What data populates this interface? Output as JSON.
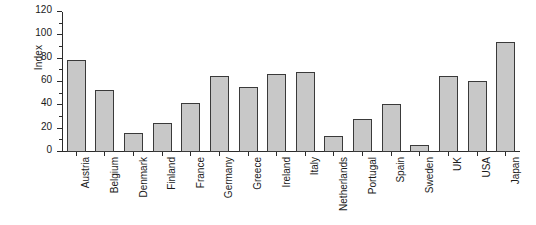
{
  "chart_data": {
    "type": "bar",
    "title": "",
    "xlabel": "",
    "ylabel": "Index",
    "ylim": [
      0,
      120
    ],
    "ytick_step": 20,
    "yminor_step": 10,
    "grid": false,
    "legend": "none",
    "orientation": "vertical",
    "bar_fill_color": "#c8c8c8",
    "bar_edge_color": "#3a3a3a",
    "background_color": "#ffffff",
    "axis_color": "#2b2b2b",
    "xtick_label_rotation": 90,
    "categories": [
      "Austria",
      "Belgium",
      "Denmark",
      "Finland",
      "France",
      "Germany",
      "Greece",
      "Ireland",
      "Italy",
      "Netherlands",
      "Portugal",
      "Spain",
      "Sweden",
      "UK",
      "USA",
      "Japan"
    ],
    "values": [
      79,
      53,
      16,
      25,
      42,
      65,
      56,
      67,
      69,
      14,
      28,
      41,
      6,
      65,
      61,
      94
    ],
    "ytick_labels": [
      "0",
      "20",
      "40",
      "60",
      "80",
      "100",
      "120"
    ],
    "ytick_values": [
      0,
      20,
      40,
      60,
      80,
      100,
      120
    ]
  }
}
